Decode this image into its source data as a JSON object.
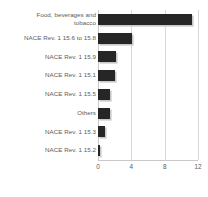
{
  "chart_data": {
    "type": "bar",
    "orientation": "horizontal",
    "title": "",
    "subtitle": "",
    "xlabel": "",
    "ylabel": "",
    "categories": [
      "Food, beverages and\ntobacco",
      "NACE Rev. 1 15.6 to 15.8",
      "NACE Rev. 1 15.9",
      "NACE Rev. 1 15.1",
      "NACE Rev. 1 15.5",
      "Others",
      "NACE Rev. 1 15.3",
      "NACE Rev. 1 15.2"
    ],
    "values": [
      11.3,
      4.1,
      2.1,
      2.0,
      1.4,
      1.4,
      0.8,
      0.2
    ],
    "xlim": [
      0,
      12
    ],
    "xticks": [
      0,
      4,
      8,
      12
    ],
    "xticklabels": [
      "0",
      "4",
      "8",
      "12"
    ],
    "grid": true,
    "grid_axis": "x",
    "legend": false,
    "bar_color": "#262626",
    "shadow_color": "#c8c8c8",
    "gridline_color": "#d8d8d8",
    "label_color": "#5a5a5a"
  }
}
